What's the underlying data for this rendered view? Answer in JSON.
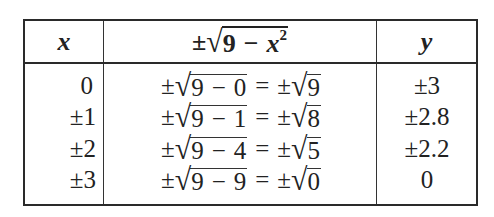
{
  "table": {
    "headers": {
      "x": "x",
      "expr": {
        "pm": "±",
        "radicand_num": "9",
        "minus": "−",
        "var": "x",
        "exp": "2"
      },
      "y": "y"
    },
    "rows": [
      {
        "x": "0",
        "pm": "±",
        "a": "9",
        "minus": "−",
        "b": "0",
        "eq": "=",
        "pm2": "±",
        "c": "9",
        "y": "±3"
      },
      {
        "x": "±1",
        "pm": "±",
        "a": "9",
        "minus": "−",
        "b": "1",
        "eq": "=",
        "pm2": "±",
        "c": "8",
        "y": "±2.8"
      },
      {
        "x": "±2",
        "pm": "±",
        "a": "9",
        "minus": "−",
        "b": "4",
        "eq": "=",
        "pm2": "±",
        "c": "5",
        "y": "±2.2"
      },
      {
        "x": "±3",
        "pm": "±",
        "a": "9",
        "minus": "−",
        "b": "9",
        "eq": "=",
        "pm2": "±",
        "c": "0",
        "y": "0"
      }
    ]
  },
  "symbols": {
    "radical": "√"
  }
}
